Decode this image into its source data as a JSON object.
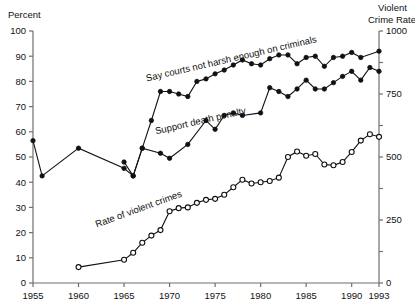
{
  "chart_data": {
    "type": "line",
    "title": "",
    "xlabel": "",
    "ylabel": "Percent",
    "y2label": "Violent Crime Rate",
    "xlim": [
      1955,
      1993
    ],
    "ylim": [
      0,
      100
    ],
    "y2lim": [
      0,
      1000
    ],
    "grid": false,
    "legend": "inline-annotations",
    "x_ticks": [
      1955,
      1960,
      1965,
      1970,
      1975,
      1980,
      1985,
      1990,
      1993
    ],
    "x_tick_labels": [
      "1955",
      "1960",
      "1965",
      "1970",
      "1975",
      "1980",
      "1985",
      "1990",
      "1993"
    ],
    "y_ticks": [
      0,
      10,
      20,
      30,
      40,
      50,
      60,
      70,
      80,
      90,
      100
    ],
    "y_tick_labels": [
      "0",
      "10",
      "20",
      "30",
      "40",
      "50",
      "60",
      "70",
      "80",
      "90",
      "100"
    ],
    "y2_ticks": [
      0,
      125,
      250,
      375,
      500,
      625,
      750,
      875,
      1000
    ],
    "y2_tick_labels": [
      "0",
      "",
      "250",
      "",
      "500",
      "",
      "750",
      "",
      "1000"
    ],
    "series": [
      {
        "name": "Say courts not harsh enough on criminals",
        "marker": "filled-circle",
        "axis": "left",
        "units": "percent",
        "points": [
          [
            1965,
            48.0
          ],
          [
            1966,
            42.5
          ],
          [
            1967,
            53.5
          ],
          [
            1968,
            64.5
          ],
          [
            1969,
            76.0
          ],
          [
            1970,
            76.0
          ],
          [
            1971,
            75.0
          ],
          [
            1972,
            74.0
          ],
          [
            1973,
            80.0
          ],
          [
            1974,
            81.0
          ],
          [
            1975,
            83.0
          ],
          [
            1976,
            84.5
          ],
          [
            1977,
            86.5
          ],
          [
            1978,
            88.5
          ],
          [
            1979,
            87.0
          ],
          [
            1980,
            86.5
          ],
          [
            1981,
            89.0
          ],
          [
            1982,
            90.5
          ],
          [
            1983,
            90.5
          ],
          [
            1984,
            87.0
          ],
          [
            1985,
            89.5
          ],
          [
            1986,
            90.0
          ],
          [
            1987,
            86.0
          ],
          [
            1988,
            89.5
          ],
          [
            1989,
            90.0
          ],
          [
            1990,
            91.5
          ],
          [
            1991,
            89.5
          ],
          [
            1993,
            92.0
          ]
        ]
      },
      {
        "name": "Support death penalty",
        "marker": "filled-circle",
        "axis": "left",
        "units": "percent",
        "points": [
          [
            1955,
            56.5
          ],
          [
            1956,
            42.5
          ],
          [
            1960,
            53.5
          ],
          [
            1965,
            45.5
          ],
          [
            1966,
            42.5
          ],
          [
            1967,
            53.5
          ],
          [
            1969,
            51.5
          ],
          [
            1970,
            49.5
          ],
          [
            1972,
            55.0
          ],
          [
            1974,
            64.5
          ],
          [
            1975,
            61.0
          ],
          [
            1976,
            66.5
          ],
          [
            1977,
            67.5
          ],
          [
            1978,
            66.5
          ],
          [
            1980,
            67.5
          ],
          [
            1981,
            77.5
          ],
          [
            1982,
            76.0
          ],
          [
            1983,
            74.0
          ],
          [
            1984,
            77.0
          ],
          [
            1985,
            80.5
          ],
          [
            1986,
            77.0
          ],
          [
            1987,
            77.0
          ],
          [
            1988,
            79.5
          ],
          [
            1989,
            82.0
          ],
          [
            1990,
            84.0
          ],
          [
            1991,
            80.5
          ],
          [
            1992,
            85.5
          ],
          [
            1993,
            84.0
          ]
        ]
      },
      {
        "name": "Rate of violent crimes",
        "marker": "open-circle",
        "axis": "right",
        "units": "per 100,000",
        "points": [
          [
            1960,
            63
          ],
          [
            1965,
            92
          ],
          [
            1966,
            120
          ],
          [
            1967,
            160
          ],
          [
            1968,
            188
          ],
          [
            1969,
            210
          ],
          [
            1970,
            285
          ],
          [
            1971,
            297
          ],
          [
            1972,
            300
          ],
          [
            1973,
            318
          ],
          [
            1974,
            330
          ],
          [
            1975,
            334
          ],
          [
            1976,
            350
          ],
          [
            1977,
            380
          ],
          [
            1978,
            410
          ],
          [
            1979,
            395
          ],
          [
            1980,
            400
          ],
          [
            1981,
            405
          ],
          [
            1982,
            418
          ],
          [
            1983,
            500
          ],
          [
            1984,
            522
          ],
          [
            1985,
            505
          ],
          [
            1986,
            512
          ],
          [
            1987,
            470
          ],
          [
            1988,
            467
          ],
          [
            1989,
            480
          ],
          [
            1990,
            520
          ],
          [
            1991,
            565
          ],
          [
            1992,
            590
          ],
          [
            1993,
            580
          ],
          [
            1994,
            605
          ],
          [
            1995,
            640
          ],
          [
            1996,
            690
          ],
          [
            1997,
            750
          ],
          [
            1998,
            755
          ]
        ]
      }
    ],
    "annotations": [
      {
        "text": "Say courts not harsh enough on criminals",
        "x": 1967.5,
        "y": 80,
        "rotation": -13
      },
      {
        "text": "Support death penalty",
        "x": 1968.5,
        "y": 59,
        "rotation": -13
      },
      {
        "text": "Rate of violent crimes",
        "x": 1962,
        "y": 22,
        "rotation": -20
      }
    ]
  },
  "axes": {
    "left_title": "Percent",
    "right_title_line1": "Violent",
    "right_title_line2": "Crime Rate"
  }
}
